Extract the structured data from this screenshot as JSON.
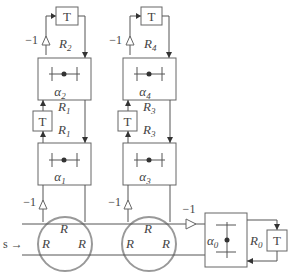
{
  "diagram": {
    "title": "",
    "input_label": "s →",
    "gain_label": "−1",
    "delay_label": "T",
    "columns": [
      {
        "top_delay": "T",
        "top_gain": "−1",
        "top_r": "R",
        "top_r_sub": "2",
        "upper_alpha": "α",
        "upper_alpha_sub": "2",
        "mid_r_top": "R",
        "mid_r_top_sub": "1",
        "mid_delay": "T",
        "mid_r_bot": "R",
        "mid_r_bot_sub": "1",
        "lower_alpha": "α",
        "lower_alpha_sub": "1",
        "bottom_gain": "−1",
        "junction_labels": [
          "R",
          "R",
          "R"
        ]
      },
      {
        "top_delay": "T",
        "top_gain": "−1",
        "top_r": "R",
        "top_r_sub": "4",
        "upper_alpha": "α",
        "upper_alpha_sub": "4",
        "mid_r_top": "R",
        "mid_r_top_sub": "3",
        "mid_delay": "T",
        "mid_r_bot": "R",
        "mid_r_bot_sub": "3",
        "lower_alpha": "α",
        "lower_alpha_sub": "3",
        "bottom_gain": "−1",
        "junction_labels": [
          "R",
          "R",
          "R"
        ]
      }
    ],
    "output_gain": "−1",
    "terminal": {
      "alpha": "α",
      "alpha_sub": "0",
      "r": "R",
      "r_sub": "0",
      "delay": "T"
    }
  }
}
